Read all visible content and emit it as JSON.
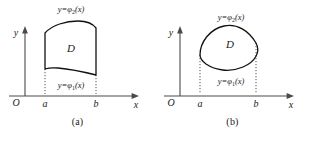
{
  "figure": {
    "background_color": "#ffffff",
    "ink_color": "#111111",
    "axis_color": "#4a4a4a",
    "panels": [
      {
        "caption": "(a)",
        "y_axis_label": "y",
        "x_axis_label": "x",
        "origin_label": "O",
        "left_bound_label": "a",
        "right_bound_label": "b",
        "region_label": "D",
        "upper_curve_label_prefix": "y=",
        "upper_curve_label_symbol": "φ",
        "upper_curve_label_subscript": "2",
        "upper_curve_label_suffix": "(x)",
        "lower_curve_label_prefix": "y=",
        "lower_curve_label_symbol": "φ",
        "lower_curve_label_subscript": "1",
        "lower_curve_label_suffix": "(x)",
        "upper_curve_label_full": "y=φ₂(x)",
        "lower_curve_label_full": "y=φ₁(x)",
        "region_shape": "vertical-sided: straight left edge at x=a, straight right edge at x=b, bulging upper arc, sagging lower arc"
      },
      {
        "caption": "(b)",
        "y_axis_label": "y",
        "x_axis_label": "x",
        "origin_label": "O",
        "left_bound_label": "a",
        "right_bound_label": "b",
        "region_label": "D",
        "upper_curve_label_prefix": "y=",
        "upper_curve_label_symbol": "φ",
        "upper_curve_label_subscript": "2",
        "upper_curve_label_suffix": "(x)",
        "lower_curve_label_prefix": "y=",
        "lower_curve_label_symbol": "φ",
        "lower_curve_label_subscript": "1",
        "lower_curve_label_suffix": "(x)",
        "upper_curve_label_full": "y=φ₂(x)",
        "lower_curve_label_full": "y=φ₁(x)",
        "region_shape": "closed rounded blob tangent to x=a on the left and x=b on the right"
      }
    ]
  }
}
